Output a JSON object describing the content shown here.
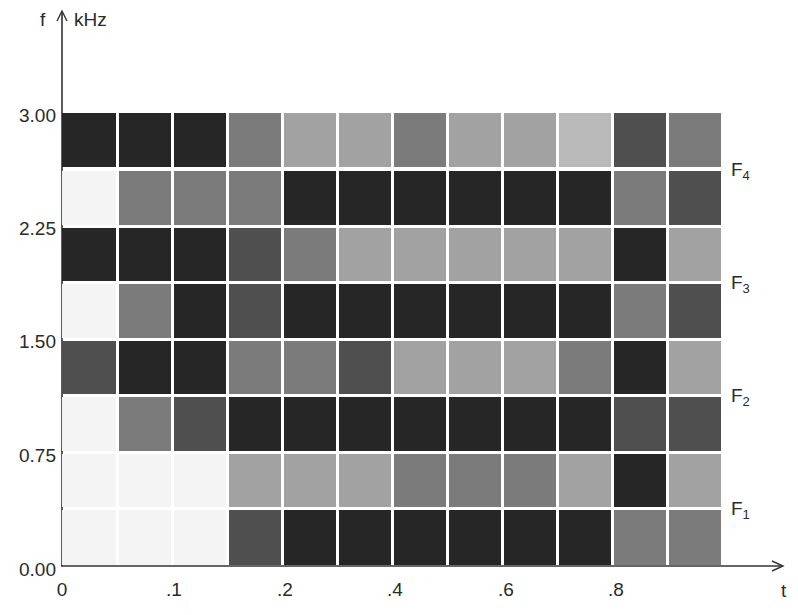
{
  "chart_data": {
    "type": "heatmap",
    "title": "",
    "xlabel": "t",
    "ylabel": "f",
    "yunit": "kHz",
    "xlim": [
      0,
      1.0
    ],
    "ylim": [
      0.0,
      3.0
    ],
    "x_ticks": [
      "0",
      ".1",
      ".2",
      ".4",
      ".6",
      ".8"
    ],
    "x_tick_values": [
      0,
      0.1,
      0.2,
      0.4,
      0.6,
      0.8
    ],
    "y_ticks": [
      "0.00",
      "0.75",
      "1.50",
      "2.25",
      "3.00"
    ],
    "y_tick_values": [
      0.0,
      0.75,
      1.5,
      2.25,
      3.0
    ],
    "grid": false,
    "n_cols": 12,
    "n_rows": 8,
    "col_width_t": 0.0833,
    "row_height_khz": 0.375,
    "formant_labels": [
      {
        "name": "F",
        "sub": "4",
        "row_boundary": 1
      },
      {
        "name": "F",
        "sub": "3",
        "row_boundary": 3
      },
      {
        "name": "F",
        "sub": "2",
        "row_boundary": 5
      },
      {
        "name": "F",
        "sub": "1",
        "row_boundary": 7
      }
    ],
    "intensity_legend": "0 = white (no energy), 4 = black (max energy)",
    "rows_top_to_bottom": [
      {
        "band_khz": "2.625-3.000",
        "values": [
          4,
          4,
          4,
          2,
          1,
          1,
          2,
          1,
          1,
          0.5,
          3,
          2
        ]
      },
      {
        "band_khz": "2.250-2.625",
        "values": [
          0,
          2,
          2,
          2,
          4,
          4,
          4,
          4,
          4,
          4,
          2,
          3
        ]
      },
      {
        "band_khz": "1.875-2.250",
        "values": [
          4,
          4,
          4,
          3,
          2,
          1,
          1,
          1,
          1,
          1,
          4,
          1
        ]
      },
      {
        "band_khz": "1.500-1.875",
        "values": [
          0,
          2,
          4,
          3,
          4,
          4,
          4,
          4,
          4,
          4,
          2,
          3
        ]
      },
      {
        "band_khz": "1.125-1.500",
        "values": [
          3,
          4,
          4,
          2,
          2,
          3,
          1,
          1,
          1,
          2,
          4,
          1
        ]
      },
      {
        "band_khz": "0.750-1.125",
        "values": [
          0,
          2,
          3,
          4,
          4,
          4,
          4,
          4,
          4,
          4,
          3,
          3
        ]
      },
      {
        "band_khz": "0.375-0.750",
        "values": [
          0,
          0,
          0,
          1,
          1,
          1,
          2,
          2,
          2,
          1,
          4,
          1
        ]
      },
      {
        "band_khz": "0.000-0.375",
        "values": [
          0,
          0,
          0,
          3,
          4,
          4,
          4,
          4,
          4,
          4,
          2,
          2
        ]
      }
    ]
  },
  "axes": {
    "y_label": "f",
    "y_unit": "kHz",
    "x_label": "t"
  },
  "palette": {
    "0": "#f4f4f4",
    "0.5": "#b9b9b9",
    "1": "#a2a2a2",
    "2": "#7b7b7b",
    "3": "#4f4f4f",
    "4": "#262626"
  }
}
